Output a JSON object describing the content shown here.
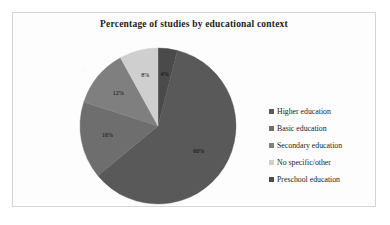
{
  "chart_data": {
    "type": "pie",
    "title": "Percentage of studies by educational context",
    "xlabel": "",
    "ylabel": "",
    "legend_position": "right",
    "grid": false,
    "categories": [
      "Higher education",
      "Basic education",
      "Secondary education",
      "No specific/other",
      "Preschool education"
    ],
    "values": [
      60,
      16,
      12,
      8,
      4
    ],
    "data_labels": [
      "60%",
      "16%",
      "12%",
      "8%",
      "4%"
    ],
    "colors": [
      "#595959",
      "#6e6e6e",
      "#7f7f7f",
      "#cfcfcf",
      "#4a4a4a"
    ],
    "slices": [
      {
        "label": "Higher education",
        "value": 60,
        "data_label": "60%",
        "color": "#595959"
      },
      {
        "label": "Basic education",
        "value": 16,
        "data_label": "16%",
        "color": "#6e6e6e"
      },
      {
        "label": "Secondary education",
        "value": 12,
        "data_label": "12%",
        "color": "#7f7f7f"
      },
      {
        "label": "No specific/other",
        "value": 8,
        "data_label": "8%",
        "color": "#cfcfcf"
      },
      {
        "label": "Preschool education",
        "value": 4,
        "data_label": "4%",
        "color": "#4a4a4a"
      }
    ]
  },
  "legend": {
    "items": [
      {
        "label": "Higher education",
        "color": "#595959"
      },
      {
        "label": "Basic education",
        "color": "#6e6e6e"
      },
      {
        "label": "Secondary education",
        "color": "#7f7f7f"
      },
      {
        "label": "No specific/other",
        "color": "#cfcfcf"
      },
      {
        "label": "Preschool education",
        "color": "#4a4a4a"
      }
    ]
  }
}
